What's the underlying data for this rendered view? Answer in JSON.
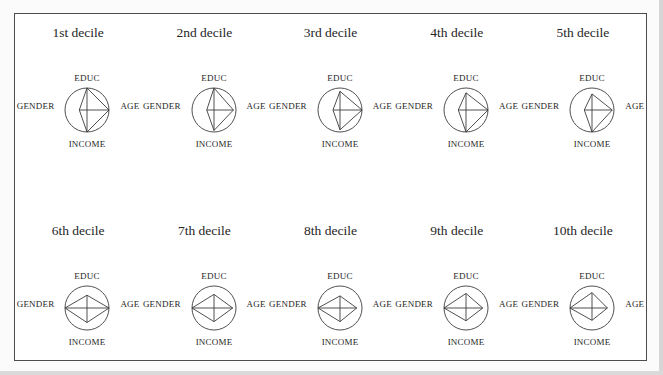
{
  "figure": {
    "background": "#ffffff",
    "frame_color": "#4c4c4c",
    "line_color": "#3c3c3c",
    "text_color": "#262626"
  },
  "chart_data": {
    "type": "radar",
    "glyph": "star",
    "axes": [
      "EDUC",
      "AGE",
      "INCOME",
      "GENDER"
    ],
    "axis_positions": [
      "top",
      "right",
      "bottom",
      "left"
    ],
    "value_range": [
      0,
      1
    ],
    "grid": {
      "rows": 2,
      "cols": 5
    },
    "legend": "none",
    "series": [
      {
        "name": "1st decile",
        "values": [
          1.0,
          1.0,
          1.0,
          0.35
        ]
      },
      {
        "name": "2nd decile",
        "values": [
          1.0,
          0.88,
          0.93,
          0.33
        ]
      },
      {
        "name": "3rd decile",
        "values": [
          0.85,
          1.0,
          0.9,
          0.32
        ]
      },
      {
        "name": "4th decile",
        "values": [
          0.78,
          1.0,
          1.0,
          0.35
        ]
      },
      {
        "name": "5th decile",
        "values": [
          0.73,
          0.92,
          1.0,
          0.35
        ]
      },
      {
        "name": "6th decile",
        "values": [
          0.58,
          1.0,
          0.66,
          1.0
        ]
      },
      {
        "name": "7th decile",
        "values": [
          0.62,
          0.85,
          0.62,
          1.0
        ]
      },
      {
        "name": "8th decile",
        "values": [
          0.55,
          0.76,
          0.62,
          1.0
        ]
      },
      {
        "name": "9th decile",
        "values": [
          0.66,
          0.76,
          0.58,
          1.0
        ]
      },
      {
        "name": "10th decile",
        "values": [
          0.7,
          0.7,
          0.56,
          1.0
        ]
      }
    ]
  }
}
